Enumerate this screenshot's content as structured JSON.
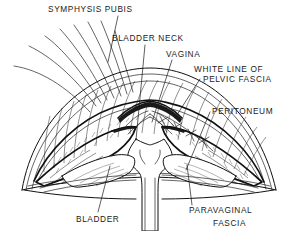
{
  "figure": {
    "kind": "anatomical-line-drawing",
    "style": "black-and-white pen-and-ink medical illustration",
    "background_color": "#ffffff",
    "ink_color": "#111111",
    "width": 296,
    "height": 231
  },
  "labels": [
    {
      "id": "symphysis-pubis",
      "text": "SYMPHYSIS PUBIS",
      "x": 48,
      "y": 12,
      "anchor": "start",
      "leader": [
        [
          118,
          16
        ],
        [
          108,
          62
        ]
      ]
    },
    {
      "id": "bladder-neck",
      "text": "BLADDER NECK",
      "x": 112,
      "y": 41,
      "anchor": "start",
      "leader": [
        [
          145,
          45
        ],
        [
          136,
          140
        ]
      ]
    },
    {
      "id": "vagina",
      "text": "VAGINA",
      "x": 166,
      "y": 57,
      "anchor": "start",
      "leader": [
        [
          172,
          60
        ],
        [
          152,
          122
        ]
      ]
    },
    {
      "id": "white-line-of-pelvic-fascia-line1",
      "text": "WHITE LINE OF",
      "x": 194,
      "y": 72,
      "anchor": "start",
      "leader": null
    },
    {
      "id": "white-line-of-pelvic-fascia-line2",
      "text": "PELVIC FASCIA",
      "x": 203,
      "y": 82,
      "anchor": "start",
      "leader": [
        [
          200,
          79
        ],
        [
          175,
          118
        ]
      ]
    },
    {
      "id": "peritoneum",
      "text": "PERITONEUM",
      "x": 212,
      "y": 114,
      "anchor": "start",
      "leader": [
        [
          210,
          112
        ],
        [
          186,
          170
        ]
      ]
    },
    {
      "id": "bladder",
      "text": "BLADDER",
      "x": 76,
      "y": 222,
      "anchor": "start",
      "leader": [
        [
          98,
          212
        ],
        [
          110,
          166
        ]
      ]
    },
    {
      "id": "paravaginal-fascia-line1",
      "text": "PARAVAGINAL",
      "x": 189,
      "y": 213,
      "anchor": "start",
      "leader": [
        [
          192,
          205
        ],
        [
          187,
          165
        ]
      ]
    },
    {
      "id": "paravaginal-fascia-line2",
      "text": "FASCIA",
      "x": 213,
      "y": 226,
      "anchor": "start",
      "leader": null
    }
  ],
  "structures": [
    {
      "id": "outer-arch",
      "name": "outer abdominal wall arc"
    },
    {
      "id": "banded-arch",
      "name": "banded muscular arch with vertical striations"
    },
    {
      "id": "shaded-band",
      "name": "stippled fascial band"
    },
    {
      "id": "central-vagina",
      "name": "central vaginal canal"
    },
    {
      "id": "bladder-mass",
      "name": "bladder mass"
    },
    {
      "id": "paravaginal-fascia-left",
      "name": "left paravaginal fascia wedge"
    },
    {
      "id": "paravaginal-fascia-right",
      "name": "right paravaginal fascia wedge"
    },
    {
      "id": "sutures",
      "name": "suture stitches along right white line"
    },
    {
      "id": "retractor-fan",
      "name": "fan of retraction / suture threads upper left"
    }
  ],
  "colors": {
    "ink": "#111111",
    "background": "#ffffff",
    "label_text": "#1a1a1a"
  }
}
